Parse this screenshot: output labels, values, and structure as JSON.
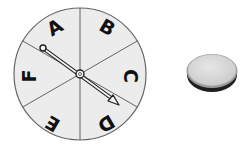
{
  "spinner": {
    "sections": [
      "A",
      "B",
      "C",
      "D",
      "E",
      "F"
    ],
    "pointer_points_to": "D",
    "fill_color": "#ececec",
    "line_color": "#555555"
  },
  "coin": {
    "face_color": "#d9d9d9",
    "edge_color": "#222222"
  }
}
